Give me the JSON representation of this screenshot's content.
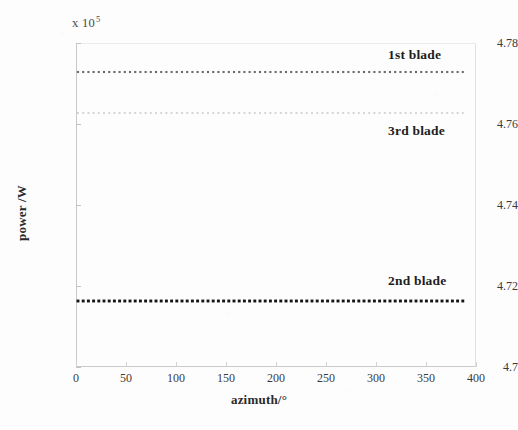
{
  "chart_data": {
    "type": "line",
    "title": "",
    "subtitle": "",
    "xlabel": "azimuth/°",
    "ylabel": "power /W",
    "y_multiplier_text": "x 10",
    "y_multiplier_exponent": "5",
    "y_multiplier_value": 100000,
    "xlim": [
      0,
      400
    ],
    "ylim": [
      4.7,
      4.78
    ],
    "x_ticks": [
      0,
      50,
      100,
      150,
      200,
      250,
      300,
      350,
      400
    ],
    "x_tick_labels": [
      "0",
      "50",
      "100",
      "150",
      "200",
      "250",
      "300",
      "350",
      "400"
    ],
    "y_ticks": [
      4.7,
      4.72,
      4.74,
      4.76,
      4.78
    ],
    "y_tick_labels": [
      "4.7",
      "4.72",
      "4.74",
      "4.76",
      "4.78"
    ],
    "grid": false,
    "legend_position": "inline-annotations",
    "x_range_of_data": [
      0,
      362
    ],
    "series": [
      {
        "name": "1st blade",
        "annotation": "1st blade",
        "marker": "square-dot",
        "color": "#6a6a6a",
        "constant_value": 4.7719,
        "values_note": "flat line across azimuth",
        "annotation_x": 388,
        "annotation_y": 47,
        "line_y_px": 72,
        "dot_size_px": 2.1,
        "dot_spacing_px": 5.2,
        "x_start_px": 78,
        "x_end_px": 466
      },
      {
        "name": "3rd blade",
        "annotation": "3rd blade",
        "marker": "square-dot",
        "color": "#d2d2d2",
        "constant_value": 4.7605,
        "values_note": "flat line across azimuth",
        "annotation_x": 388,
        "annotation_y": 123,
        "line_y_px": 113,
        "dot_size_px": 1.9,
        "dot_spacing_px": 5.2,
        "x_start_px": 78,
        "x_end_px": 466
      },
      {
        "name": "2nd blade",
        "annotation": "2nd blade",
        "marker": "square-dot",
        "color": "#141414",
        "constant_value": 4.7165,
        "values_note": "flat line across azimuth",
        "annotation_x": 388,
        "annotation_y": 273,
        "line_y_px": 301,
        "dot_size_px": 2.9,
        "dot_spacing_px": 5.2,
        "x_start_px": 78,
        "x_end_px": 466
      }
    ]
  }
}
